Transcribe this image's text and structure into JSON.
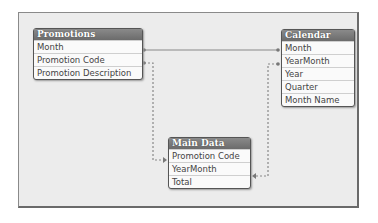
{
  "diagram": {
    "tables": [
      {
        "name": "Promotions",
        "fields": [
          "Month",
          "Promotion Code",
          "Promotion Description"
        ]
      },
      {
        "name": "Calendar",
        "fields": [
          "Month",
          "YearMonth",
          "Year",
          "Quarter",
          "Month Name"
        ]
      },
      {
        "name": "Main Data",
        "fields": [
          "Promotion Code",
          "YearMonth",
          "Total"
        ]
      }
    ],
    "links": [
      {
        "from": "Promotions.Month",
        "to": "Calendar.Month",
        "style": "solid"
      },
      {
        "from": "Promotions.Promotion Code",
        "to": "Main Data.Promotion Code",
        "style": "dashed"
      },
      {
        "from": "Calendar.YearMonth",
        "to": "Main Data.YearMonth",
        "style": "dashed"
      }
    ]
  }
}
